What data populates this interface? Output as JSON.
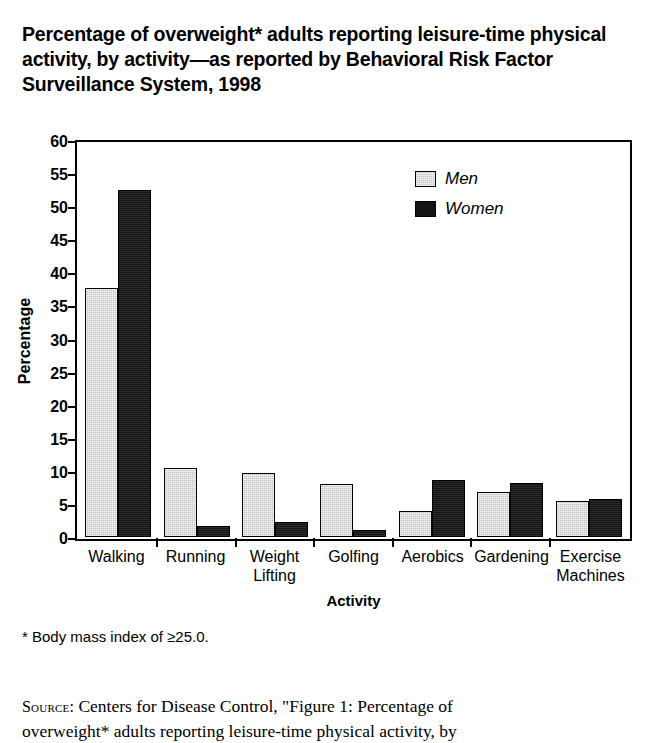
{
  "title": "Percentage of overweight* adults reporting leisure-time physical activity, by activity—as reported by Behavioral Risk Factor Surveillance System, 1998",
  "footnote": "* Body mass index of ≥25.0.",
  "source": {
    "kicker": "Source:",
    "line1": " Centers for Disease Control, \"Figure 1: Percentage of",
    "line2": "overweight* adults reporting leisure-time physical activity, by"
  },
  "legend": {
    "position": "top-right",
    "entries": [
      {
        "label": "Men",
        "color": "#c4c4c4"
      },
      {
        "label": "Women",
        "color": "#141414"
      }
    ]
  },
  "chart_data": {
    "type": "bar",
    "title": "Percentage of overweight* adults reporting leisure-time physical activity, by activity—as reported by Behavioral Risk Factor Surveillance System, 1998",
    "xlabel": "Activity",
    "ylabel": "Percentage",
    "ylim": [
      0,
      60
    ],
    "yticks": [
      0,
      5,
      10,
      15,
      20,
      25,
      30,
      35,
      40,
      45,
      50,
      55,
      60
    ],
    "ytick_labels": [
      "0",
      "5",
      "10",
      "15",
      "20",
      "25",
      "30",
      "35",
      "40",
      "45",
      "50",
      "55",
      "60"
    ],
    "grid": false,
    "categories": [
      "Walking",
      "Running",
      "Weight Lifting",
      "Golfing",
      "Aerobics",
      "Gardening",
      "Exercise Machines"
    ],
    "category_lines": [
      [
        "Walking"
      ],
      [
        "Running"
      ],
      [
        "Weight",
        "Lifting"
      ],
      [
        "Golfing"
      ],
      [
        "Aerobics"
      ],
      [
        "Gardening"
      ],
      [
        "Exercise",
        "Machines"
      ]
    ],
    "series": [
      {
        "name": "Men",
        "color": "#c4c4c4",
        "values": [
          37.7,
          10.5,
          9.6,
          8.0,
          3.9,
          6.8,
          5.5
        ]
      },
      {
        "name": "Women",
        "color": "#141414",
        "values": [
          52.5,
          1.6,
          2.2,
          1.0,
          8.6,
          8.1,
          5.8
        ]
      }
    ]
  }
}
